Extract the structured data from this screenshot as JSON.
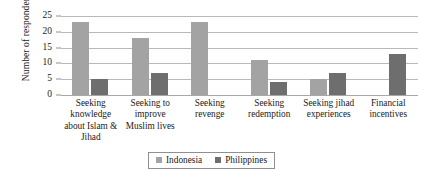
{
  "chart_data": {
    "type": "bar",
    "title": "",
    "xlabel": "",
    "ylabel": "Number of respondents",
    "ylim": [
      0,
      25
    ],
    "yticks": [
      0,
      5,
      10,
      15,
      20,
      25
    ],
    "grid": true,
    "legend_position": "bottom-center",
    "categories": [
      "Seeking knowledge about Islam & Jihad",
      "Seeking to improve Muslim lives",
      "Seeking revenge",
      "Seeking redemption",
      "Seeking jihad experiences",
      "Financial incentives"
    ],
    "category_lines": [
      [
        "Seeking",
        "knowledge",
        "about Islam &",
        "Jihad"
      ],
      [
        "Seeking to",
        "improve",
        "Muslim lives"
      ],
      [
        "Seeking",
        "revenge"
      ],
      [
        "Seeking",
        "redemption"
      ],
      [
        "Seeking jihad",
        "experiences"
      ],
      [
        "Financial",
        "incentives"
      ]
    ],
    "series": [
      {
        "name": "Indonesia",
        "color": "#a3a3a3",
        "values": [
          23,
          18,
          23,
          11,
          5,
          0
        ]
      },
      {
        "name": "Philippines",
        "color": "#6e6e6e",
        "values": [
          5,
          7,
          0,
          4,
          7,
          13
        ]
      }
    ]
  },
  "legend": {
    "items": [
      {
        "label": "Indonesia",
        "color": "#a3a3a3"
      },
      {
        "label": "Philippines",
        "color": "#6e6e6e"
      }
    ]
  }
}
